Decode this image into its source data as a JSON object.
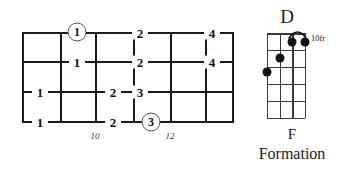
{
  "meta": {
    "background_color": "#ffffff",
    "ink_color": "#111111",
    "circle_stroke_color": "#555555"
  },
  "tab_grid": {
    "name": "horizontal-fretboard-tab",
    "strings": 4,
    "string_ys": [
      33,
      62,
      92,
      122
    ],
    "fret_xs": [
      22,
      60,
      95,
      133,
      170,
      205,
      233
    ],
    "fret_markers": [
      {
        "label": "10",
        "x": 95,
        "y": 133
      },
      {
        "label": "12",
        "x": 170,
        "y": 133
      }
    ],
    "fingerings": [
      {
        "value": "1",
        "x": 77,
        "y": 33,
        "circled": true
      },
      {
        "value": "2",
        "x": 140,
        "y": 33,
        "circled": false
      },
      {
        "value": "4",
        "x": 212,
        "y": 33,
        "circled": false
      },
      {
        "value": "1",
        "x": 77,
        "y": 62,
        "circled": false
      },
      {
        "value": "2",
        "x": 140,
        "y": 62,
        "circled": false
      },
      {
        "value": "4",
        "x": 212,
        "y": 62,
        "circled": false
      },
      {
        "value": "1",
        "x": 40,
        "y": 92,
        "circled": false
      },
      {
        "value": "2",
        "x": 113,
        "y": 92,
        "circled": false
      },
      {
        "value": "3",
        "x": 140,
        "y": 92,
        "circled": false
      },
      {
        "value": "1",
        "x": 40,
        "y": 122,
        "circled": false
      },
      {
        "value": "2",
        "x": 113,
        "y": 122,
        "circled": false
      },
      {
        "value": "3",
        "x": 151,
        "y": 122,
        "circled": true
      }
    ]
  },
  "chord_diagram": {
    "name": "chord-diagram-d",
    "title": "D",
    "position_label": "10fr",
    "caption_line1": "F",
    "caption_line2": "Formation",
    "strings": 4,
    "frets": 5,
    "grid": {
      "left": 267,
      "top": 33,
      "width": 38,
      "height": 85
    },
    "dots": [
      {
        "string": 1,
        "fret": 1,
        "x": 277,
        "y": 72
      },
      {
        "string": 2,
        "fret": 1,
        "x": 286,
        "y": 58
      },
      {
        "string": 3,
        "fret": 1,
        "x": 296,
        "y": 42
      },
      {
        "string": 4,
        "fret": 1,
        "x": 305,
        "y": 42
      }
    ],
    "arc": {
      "from_x": 296,
      "to_x": 305,
      "y": 35
    }
  }
}
